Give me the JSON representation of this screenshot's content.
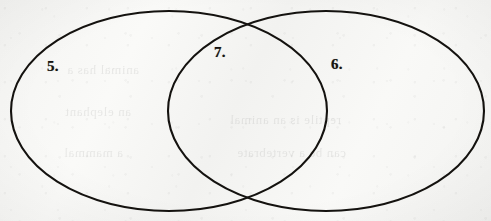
{
  "diagram": {
    "type": "venn-two-set",
    "title": "",
    "medium": "hand-drawn on paper",
    "background_color": "#f7f7f5",
    "stroke_color": "#14120f",
    "stroke_width": 2.1,
    "labels": [
      {
        "id": "label-5",
        "text": "5.",
        "region": "left-only",
        "x": 47,
        "y": 59
      },
      {
        "id": "label-7",
        "text": "7.",
        "region": "intersection",
        "x": 214,
        "y": 45
      },
      {
        "id": "label-6",
        "text": "6.",
        "region": "right-only",
        "x": 331,
        "y": 57
      }
    ],
    "shapes": [
      {
        "name": "left-ellipse",
        "cx": 169,
        "cy": 111,
        "rx": 158,
        "ry": 100
      },
      {
        "name": "right-ellipse",
        "cx": 326,
        "cy": 111,
        "rx": 158,
        "ry": 100
      }
    ],
    "intersection_points": [
      {
        "x": 246,
        "y": 21
      },
      {
        "x": 248,
        "y": 203
      }
    ]
  },
  "showthrough": {
    "note": "faint mirrored bleed-through text from the reverse side of the page",
    "lines": [
      {
        "text": "animal has a",
        "x": 352,
        "y": 62,
        "size": 13
      },
      {
        "text": "reptile is an animal",
        "x": 150,
        "y": 112,
        "size": 13
      },
      {
        "text": "an elephant",
        "x": 360,
        "y": 104,
        "size": 13
      },
      {
        "text": "can be a vertebrate",
        "x": 145,
        "y": 145,
        "size": 13
      },
      {
        "text": "a mammal",
        "x": 368,
        "y": 145,
        "size": 13
      }
    ]
  }
}
